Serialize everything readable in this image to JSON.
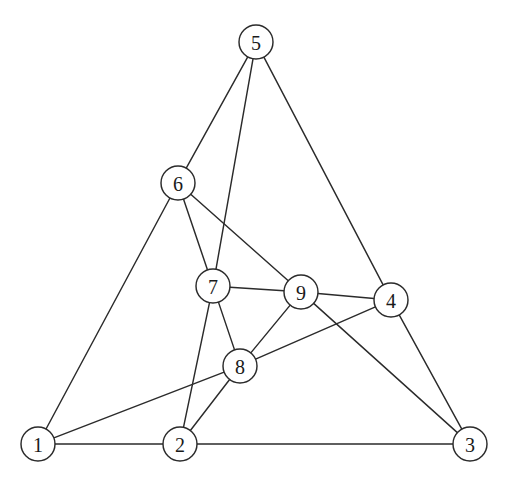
{
  "figure": {
    "background_color": "#ffffff",
    "stroke_color": "#2b2b2b",
    "node_fill_color": "#ffffff",
    "label_color": "#1a1a1a",
    "node_radius": 17
  },
  "chart_data": {
    "type": "diagram",
    "graph_type": "undirected-graph",
    "title": "",
    "node_count": 9,
    "edge_count": 18,
    "nodes": [
      {
        "id": "1",
        "label": "1",
        "x": 38,
        "y": 444
      },
      {
        "id": "2",
        "label": "2",
        "x": 180,
        "y": 444
      },
      {
        "id": "3",
        "label": "3",
        "x": 470,
        "y": 444
      },
      {
        "id": "4",
        "label": "4",
        "x": 391,
        "y": 300
      },
      {
        "id": "5",
        "label": "5",
        "x": 256,
        "y": 42
      },
      {
        "id": "6",
        "label": "6",
        "x": 178,
        "y": 183
      },
      {
        "id": "7",
        "label": "7",
        "x": 213,
        "y": 286
      },
      {
        "id": "8",
        "label": "8",
        "x": 240,
        "y": 366
      },
      {
        "id": "9",
        "label": "9",
        "x": 301,
        "y": 292
      }
    ],
    "edges": [
      {
        "source": "1",
        "target": "2"
      },
      {
        "source": "1",
        "target": "6"
      },
      {
        "source": "1",
        "target": "8"
      },
      {
        "source": "2",
        "target": "3"
      },
      {
        "source": "2",
        "target": "7"
      },
      {
        "source": "2",
        "target": "8"
      },
      {
        "source": "3",
        "target": "4"
      },
      {
        "source": "3",
        "target": "9"
      },
      {
        "source": "4",
        "target": "5"
      },
      {
        "source": "4",
        "target": "8"
      },
      {
        "source": "4",
        "target": "9"
      },
      {
        "source": "5",
        "target": "6"
      },
      {
        "source": "5",
        "target": "7"
      },
      {
        "source": "6",
        "target": "7"
      },
      {
        "source": "6",
        "target": "9"
      },
      {
        "source": "7",
        "target": "8"
      },
      {
        "source": "7",
        "target": "9"
      },
      {
        "source": "8",
        "target": "9"
      }
    ]
  }
}
